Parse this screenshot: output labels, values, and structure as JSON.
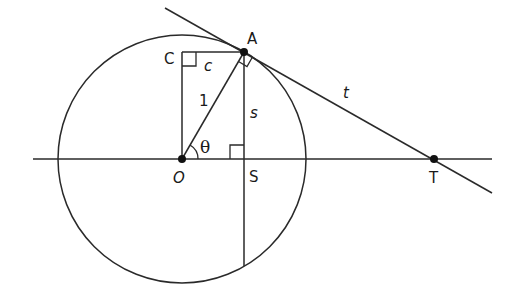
{
  "diagram": {
    "type": "unit-circle-trig-geometry",
    "colors": {
      "stroke": "#2a2a2a",
      "background": "#ffffff",
      "point": "#111111"
    },
    "points": {
      "O": {
        "label": "O",
        "x": 182,
        "y": 159
      },
      "A": {
        "label": "A",
        "x": 244,
        "y": 52
      },
      "C": {
        "label": "C",
        "x": 182,
        "y": 52
      },
      "S": {
        "label": "S",
        "x": 244,
        "y": 159
      },
      "T": {
        "label": "T",
        "x": 434,
        "y": 159
      }
    },
    "segment_labels": {
      "radius": "1",
      "cos": "c",
      "sin": "s",
      "tangent": "t",
      "angle": "θ"
    }
  }
}
